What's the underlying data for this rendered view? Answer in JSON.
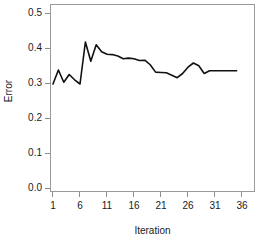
{
  "chart_data": {
    "type": "line",
    "title": "",
    "xlabel": "Iteration",
    "ylabel": "Error",
    "xlim": [
      1,
      36
    ],
    "ylim": [
      0.0,
      0.5
    ],
    "grid": false,
    "legend": null,
    "xticks": [
      "1",
      "6",
      "11",
      "16",
      "21",
      "26",
      "31",
      "36"
    ],
    "xtick_values": [
      1,
      6,
      11,
      16,
      21,
      26,
      31,
      36
    ],
    "yticks": [
      "0.0",
      "0.1",
      "0.2",
      "0.3",
      "0.4",
      "0.5"
    ],
    "ytick_values": [
      0.0,
      0.1,
      0.2,
      0.3,
      0.4,
      0.5
    ],
    "series": [
      {
        "name": "Error",
        "color": "#111111",
        "x": [
          1,
          2,
          3,
          4,
          5,
          6,
          7,
          8,
          9,
          10,
          11,
          12,
          13,
          14,
          15,
          16,
          17,
          18,
          19,
          20,
          21,
          22,
          23,
          24,
          25,
          26,
          27,
          28,
          29,
          30,
          31,
          32,
          33,
          34,
          35
        ],
        "values": [
          0.3,
          0.34,
          0.305,
          0.327,
          0.312,
          0.3,
          0.42,
          0.365,
          0.412,
          0.392,
          0.385,
          0.384,
          0.38,
          0.372,
          0.374,
          0.372,
          0.367,
          0.368,
          0.355,
          0.334,
          0.333,
          0.332,
          0.325,
          0.318,
          0.33,
          0.348,
          0.36,
          0.352,
          0.33,
          0.338,
          0.338,
          0.338,
          0.338,
          0.338,
          0.338
        ]
      }
    ]
  },
  "axes": {
    "y_title": "Error",
    "x_title": "Iteration"
  }
}
